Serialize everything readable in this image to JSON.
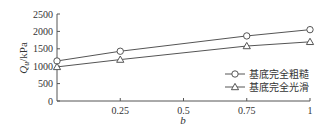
{
  "chart_data": {
    "type": "line",
    "title": "",
    "xlabel": "b",
    "ylabel": "Q_u/kPa",
    "ylabel_main": "Q",
    "ylabel_sub": "u",
    "ylabel_unit": "/kPa",
    "x": [
      0,
      0.25,
      0.75,
      1
    ],
    "xlim": [
      0,
      1
    ],
    "ylim": [
      0,
      2500
    ],
    "xticks": [
      0.25,
      0.5,
      0.75,
      1
    ],
    "xtick_labels": [
      "0.25",
      "0.5",
      "0.75",
      "1"
    ],
    "yticks": [
      0,
      500,
      1000,
      1500,
      2000,
      2500
    ],
    "ytick_labels": [
      "0",
      "500",
      "1000",
      "1500",
      "2000",
      "2500"
    ],
    "grid": false,
    "legend_position": "lower right",
    "series": [
      {
        "name": "基底完全粗糙",
        "marker": "circle",
        "values": [
          1150,
          1430,
          1870,
          2050
        ]
      },
      {
        "name": "基底完全光滑",
        "marker": "triangle",
        "values": [
          980,
          1190,
          1580,
          1700
        ]
      }
    ]
  }
}
